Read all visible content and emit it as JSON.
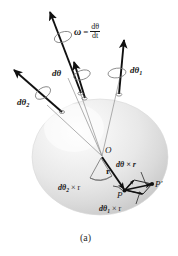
{
  "figure": {
    "caption": "(a)",
    "type": "physics-vector-diagram",
    "colors": {
      "ink": "#1a1a1a",
      "sphere_light": "#fbfbfb",
      "sphere_mid": "#e6e6e6",
      "sphere_dark": "#cfcfcf",
      "thin_line": "#8a8a8a",
      "background": "#ffffff"
    },
    "labels": {
      "omega_symbol": "ω",
      "omega_equals": "=",
      "omega_numerator": "dθ",
      "omega_denominator": "dt",
      "dtheta": "dθ",
      "dtheta1": "dθ",
      "dtheta1_sub": "1",
      "dtheta2": "dθ",
      "dtheta2_sub": "2",
      "origin": "O",
      "r_vector": "r",
      "dtheta_cross_r": "dθ × r",
      "dtheta1_cross_r_pre": "dθ",
      "dtheta1_cross_r_sub": "1",
      "dtheta1_cross_r_post": " × r",
      "dtheta2_cross_r_pre": "dθ",
      "dtheta2_cross_r_sub": "2",
      "dtheta2_cross_r_post": " × r",
      "point_P": "P",
      "point_P_prime": "P′",
      "cross_symbol": "×"
    }
  }
}
